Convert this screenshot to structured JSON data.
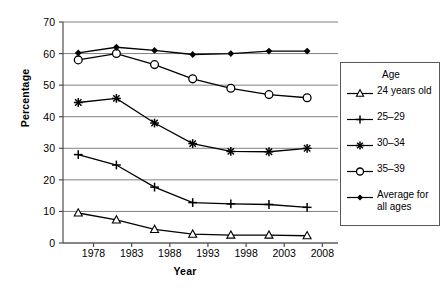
{
  "chart_data": {
    "type": "line",
    "title": "",
    "xlabel": "Year",
    "ylabel": "Percentage",
    "x": [
      1976,
      1981,
      1986,
      1991,
      1996,
      2001,
      2006
    ],
    "xticks": [
      "1978",
      "1983",
      "1988",
      "1993",
      "1998",
      "2003",
      "2008"
    ],
    "xtick_values": [
      1978,
      1983,
      1988,
      1993,
      1998,
      2003,
      2008
    ],
    "yticks": [
      "0",
      "10",
      "20",
      "30",
      "40",
      "50",
      "60",
      "70"
    ],
    "ytick_values": [
      0,
      10,
      20,
      30,
      40,
      50,
      60,
      70
    ],
    "xlim": [
      1974,
      2009
    ],
    "ylim": [
      0,
      70
    ],
    "grid": "horizontal",
    "legend_position": "right",
    "series": [
      {
        "name": "24 years old",
        "marker": "triangle-open",
        "values": [
          9.5,
          7.3,
          4.3,
          2.8,
          2.5,
          2.5,
          2.3
        ]
      },
      {
        "name": "25–29",
        "marker": "plus",
        "values": [
          28.0,
          24.7,
          17.7,
          12.8,
          12.4,
          12.2,
          11.3
        ]
      },
      {
        "name": "30–34",
        "marker": "asterisk",
        "values": [
          44.5,
          45.8,
          38.0,
          31.5,
          29.0,
          28.9,
          30.0
        ]
      },
      {
        "name": "35–39",
        "marker": "circle-open",
        "values": [
          58.0,
          60.0,
          56.5,
          52.0,
          49.0,
          47.0,
          46.0
        ]
      },
      {
        "name": "Average for\nall ages",
        "marker": "diamond-filled",
        "values": [
          60.2,
          62.0,
          61.0,
          59.7,
          60.0,
          60.8,
          60.8
        ]
      }
    ]
  },
  "legend": {
    "title": "Age",
    "entries": [
      {
        "label": "24 years old"
      },
      {
        "label": "25–29"
      },
      {
        "label": "30–34"
      },
      {
        "label": "35–39"
      },
      {
        "label": "Average for\nall ages"
      }
    ]
  },
  "colors": {
    "line": "#000000",
    "grid": "#808080",
    "axis": "#4d4d4d",
    "background": "#ffffff"
  }
}
